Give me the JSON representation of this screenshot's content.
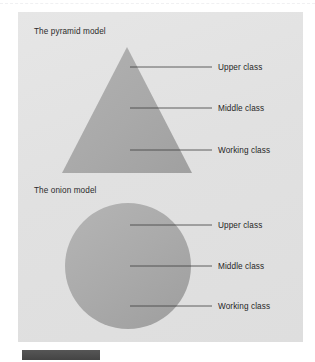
{
  "figure": {
    "background_color": "#e3e3e3",
    "shape_color": "#a9a9a9",
    "line_color": "#3c3c3c",
    "text_color": "#262626",
    "caption_bar_color": "#4a4a4a"
  },
  "pyramid": {
    "title": "The pyramid model",
    "shape": "triangle",
    "callouts": [
      {
        "label": "Upper class",
        "line_y": 67,
        "line_x1": 130,
        "line_x2": 212,
        "label_x": 218
      },
      {
        "label": "Middle class",
        "line_y": 108,
        "line_x1": 130,
        "line_x2": 212,
        "label_x": 218
      },
      {
        "label": "Working class",
        "line_y": 150,
        "line_x1": 130,
        "line_x2": 212,
        "label_x": 218
      }
    ],
    "geometry": {
      "apex_x": 127,
      "apex_y": 47,
      "base_y": 173,
      "base_left_x": 62,
      "base_right_x": 192
    }
  },
  "onion": {
    "title": "The onion model",
    "shape": "circle",
    "callouts": [
      {
        "label": "Upper class",
        "line_y": 225,
        "line_x1": 130,
        "line_x2": 212,
        "label_x": 218
      },
      {
        "label": "Middle class",
        "line_y": 266,
        "line_x1": 130,
        "line_x2": 212,
        "label_x": 218
      },
      {
        "label": "Working class",
        "line_y": 306,
        "line_x1": 130,
        "line_x2": 212,
        "label_x": 218
      }
    ],
    "geometry": {
      "center_x": 128,
      "center_y": 266,
      "radius": 63
    }
  }
}
